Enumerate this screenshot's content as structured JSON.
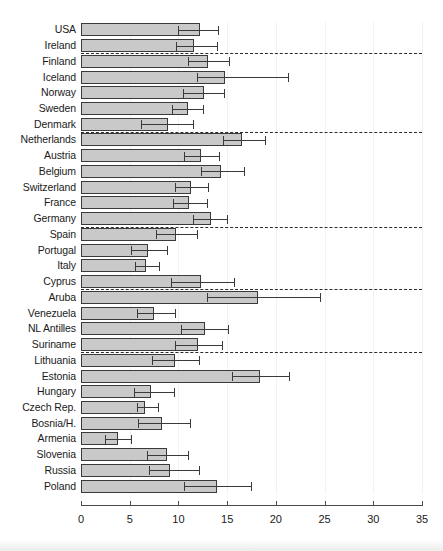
{
  "chart_data": {
    "type": "bar",
    "orientation": "horizontal",
    "title": "",
    "xlabel": "",
    "ylabel": "",
    "xlim": [
      0,
      35
    ],
    "xticks": [
      0,
      5,
      10,
      15,
      20,
      25,
      30,
      35
    ],
    "xtick_labels": [
      "0",
      "5",
      "10",
      "15",
      "20",
      "25",
      "30",
      "35"
    ],
    "grid": false,
    "legend": "none",
    "error_bars": "confidence interval (low to high)",
    "bar_fill_color": "#c9c9c9",
    "bar_edge_color": "#3a3a3a",
    "separator_style": "dashed",
    "categories": [
      "USA",
      "Ireland",
      "Finland",
      "Iceland",
      "Norway",
      "Sweden",
      "Denmark",
      "Netherlands",
      "Austria",
      "Belgium",
      "Switzerland",
      "France",
      "Germany",
      "Spain",
      "Portugal",
      "Italy",
      "Cyprus",
      "Aruba",
      "Venezuela",
      "NL Antilles",
      "Suriname",
      "Lithuania",
      "Estonia",
      "Hungary",
      "Czech Rep.",
      "Bosnia/H.",
      "Armenia",
      "Slovenia",
      "Russia",
      "Poland"
    ],
    "values": [
      12.2,
      11.6,
      13.0,
      14.8,
      12.6,
      11.0,
      8.9,
      16.5,
      12.3,
      14.4,
      11.3,
      11.1,
      13.3,
      9.8,
      6.9,
      6.7,
      12.3,
      18.2,
      7.5,
      12.7,
      12.0,
      9.6,
      18.4,
      7.2,
      6.6,
      8.3,
      3.8,
      8.8,
      9.1,
      14.0
    ],
    "error_low": [
      10.0,
      9.7,
      11.0,
      11.9,
      10.5,
      9.3,
      6.2,
      14.6,
      10.6,
      12.3,
      9.6,
      9.4,
      11.5,
      7.7,
      5.1,
      5.5,
      9.2,
      12.9,
      5.7,
      10.3,
      9.6,
      7.3,
      15.5,
      5.4,
      5.7,
      5.9,
      2.5,
      6.8,
      7.0,
      10.6
    ],
    "error_high": [
      14.1,
      14.0,
      15.2,
      21.2,
      14.7,
      12.5,
      11.5,
      18.9,
      14.2,
      16.7,
      13.0,
      12.9,
      15.0,
      11.9,
      8.8,
      8.0,
      15.7,
      24.5,
      9.6,
      15.1,
      14.5,
      12.1,
      21.3,
      9.5,
      7.9,
      11.2,
      5.1,
      11.0,
      12.1,
      17.4
    ],
    "group_separators_after": [
      "Ireland",
      "Denmark",
      "Germany",
      "Cyprus",
      "Suriname"
    ]
  }
}
